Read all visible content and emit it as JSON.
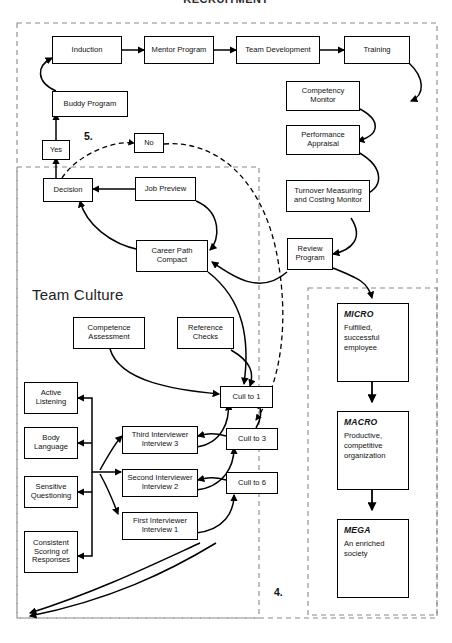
{
  "title": "RECRUITMENT",
  "sections": {
    "team_culture_caption": "Team Culture",
    "marker_5": "5.",
    "marker_4": "4."
  },
  "nodes": {
    "induction": "Induction",
    "mentor_program": "Mentor Program",
    "team_development": "Team Development",
    "training": "Training",
    "buddy_program": "Buddy Program",
    "competency_monitor": "Competency Monitor",
    "performance_appraisal": "Performance Appraisal",
    "turnover_monitor": "Turnover Measuring and Costing Monitor",
    "review_program": "Review Program",
    "yes": "Yes",
    "no": "No",
    "decision": "Decision",
    "job_preview": "Job Preview",
    "career_path_compact": "Career Path Compact",
    "competence_assessment": "Competence Assessment",
    "reference_checks": "Reference Checks",
    "cull_to_1": "Cull to 1",
    "cull_to_3": "Cull to 3",
    "cull_to_6": "Cull to 6",
    "third_interviewer": "Third Interviewer Interview 3",
    "second_interviewer": "Second Interviewer Interview 2",
    "first_interviewer": "First Interviewer Interview 1",
    "active_listening": "Active Listening",
    "body_language": "Body Language",
    "sensitive_questioning": "Sensitive Questioning",
    "consistent_scoring": "Consistent Scoring of Responses"
  },
  "outcomes": [
    {
      "head": "MICRO",
      "body": "Fulfilled, successful employee"
    },
    {
      "head": "MACRO",
      "body": "Productive, competitive organization"
    },
    {
      "head": "MEGA",
      "body": "An enriched society"
    }
  ],
  "colors": {
    "stroke": "#000000",
    "dashed_border": "#8a8a8a",
    "background": "#ffffff"
  }
}
